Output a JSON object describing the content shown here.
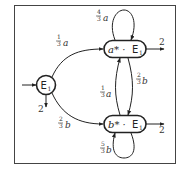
{
  "diagram": {
    "type": "weighted-automaton",
    "states": [
      {
        "id": "s0",
        "label": "E",
        "sub": "1",
        "prefix": "",
        "shape": "circle",
        "initial": true,
        "final_weight": "2"
      },
      {
        "id": "s1",
        "label": "E",
        "sub": "1",
        "prefix": "a* · ",
        "shape": "rounded-rect",
        "initial": false,
        "final_weight": "2"
      },
      {
        "id": "s2",
        "label": "E",
        "sub": "1",
        "prefix": "b* · ",
        "shape": "rounded-rect",
        "initial": false,
        "final_weight": "2"
      }
    ],
    "transitions": [
      {
        "from": "s0",
        "to": "s1",
        "num": "1",
        "den": "3",
        "letter": "a"
      },
      {
        "from": "s0",
        "to": "s2",
        "num": "2",
        "den": "3",
        "letter": "b"
      },
      {
        "from": "s1",
        "to": "s1",
        "num": "4",
        "den": "3",
        "letter": "a"
      },
      {
        "from": "s1",
        "to": "s2",
        "num": "2",
        "den": "3",
        "letter": "b"
      },
      {
        "from": "s2",
        "to": "s1",
        "num": "1",
        "den": "3",
        "letter": "a"
      },
      {
        "from": "s2",
        "to": "s2",
        "num": "5",
        "den": "3",
        "letter": "b"
      }
    ]
  }
}
